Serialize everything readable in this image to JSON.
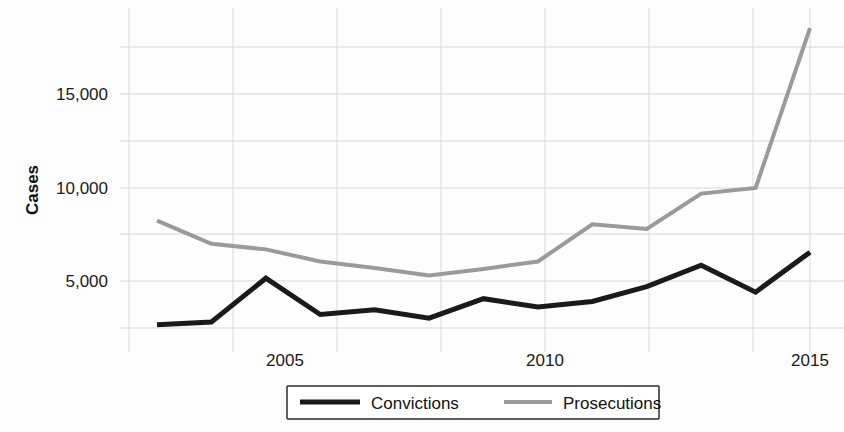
{
  "chart_data": {
    "type": "line",
    "title": "",
    "xlabel": "",
    "ylabel": "Cases",
    "x": [
      2003,
      2004,
      2005,
      2006,
      2007,
      2008,
      2009,
      2010,
      2011,
      2012,
      2013,
      2014,
      2015
    ],
    "xlim": [
      2003,
      2015
    ],
    "ylim": [
      0,
      19500
    ],
    "grid": true,
    "legend_position": "bottom",
    "y_ticks": [
      5000,
      10000,
      15000
    ],
    "y_tick_labels": [
      "5,000",
      "10,000",
      "15,000"
    ],
    "y_minor_gridlines": [
      2500,
      7500,
      12500,
      17500
    ],
    "x_ticks": [
      2005,
      2010,
      2015
    ],
    "x_tick_labels": [
      "2005",
      "2010",
      "2015"
    ],
    "series": [
      {
        "name": "Convictions",
        "color": "#1a1a1a",
        "values": [
          2650,
          2800,
          5150,
          3200,
          3450,
          3000,
          4050,
          3600,
          3900,
          4700,
          5850,
          4400,
          6550
        ]
      },
      {
        "name": "Prosecutions",
        "color": "#9a9a9a",
        "values": [
          8250,
          7000,
          6700,
          6050,
          5700,
          5300,
          5650,
          6050,
          8050,
          7800,
          9700,
          10000,
          18600
        ]
      }
    ]
  },
  "legend": {
    "items": [
      {
        "label": "Convictions",
        "color": "#1a1a1a"
      },
      {
        "label": "Prosecutions",
        "color": "#9a9a9a"
      }
    ]
  },
  "axis": {
    "y_title": "Cases",
    "y_labels": [
      "15,000",
      "10,000",
      "5,000"
    ],
    "x_labels": [
      "2005",
      "2010",
      "2015"
    ]
  }
}
